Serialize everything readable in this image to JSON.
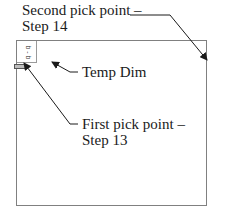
{
  "callouts": {
    "second_pick": {
      "line1": "Second pick point –",
      "line2": "Step 14"
    },
    "temp_dim": {
      "label": "Temp Dim"
    },
    "first_pick": {
      "line1": "First pick point –",
      "line2": "Step 13"
    }
  },
  "temp_dim_value": "b - b",
  "icons": {
    "arrow": "leader-arrow-icon",
    "marker": "pick-point-marker-icon"
  }
}
